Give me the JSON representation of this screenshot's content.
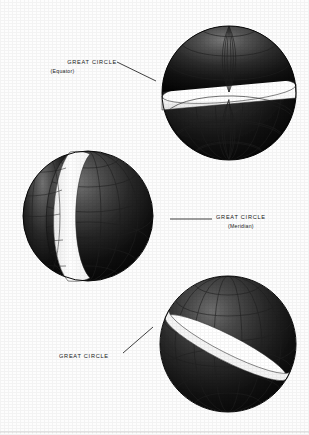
{
  "figure": {
    "background_color": "#fdfdfd",
    "ink_color": "#111111",
    "band_color": "#ffffff",
    "width": 309,
    "height": 435,
    "bottom_rule": true
  },
  "labels": [
    {
      "id": "equator",
      "text": "GREAT CIRCLE",
      "sub": "(Equator)",
      "x": 59,
      "y": 58,
      "leader": {
        "x1": 117,
        "y1": 62,
        "x2": 156,
        "y2": 81
      }
    },
    {
      "id": "meridian",
      "text": "GREAT CIRCLE",
      "sub": "(Meridian)",
      "x": 216,
      "y": 213,
      "leader": {
        "x1": 170,
        "y1": 219,
        "x2": 212,
        "y2": 219
      }
    },
    {
      "id": "oblique",
      "text": "GREAT CIRCLE",
      "sub": "",
      "x": 59,
      "y": 352,
      "leader": {
        "x1": 123,
        "y1": 353,
        "x2": 153,
        "y2": 327
      }
    }
  ],
  "spheres": [
    {
      "id": "sphere-equator",
      "name": "sphere-sliced-equatorial",
      "cx": 229,
      "cy": 93,
      "r": 67,
      "slice": "equatorial",
      "band_angle_deg": 9,
      "description": "Sphere split by a horizontal equatorial plane; white band visible"
    },
    {
      "id": "sphere-meridian",
      "name": "sphere-sliced-meridian",
      "cx": 88,
      "cy": 216,
      "r": 65,
      "slice": "meridian",
      "band_angle_deg": 82,
      "description": "Sphere split by a vertical meridian plane; white crescent band visible"
    },
    {
      "id": "sphere-oblique",
      "name": "sphere-sliced-oblique",
      "cx": 228,
      "cy": 344,
      "r": 68,
      "slice": "oblique",
      "band_angle_deg": 28,
      "description": "Sphere split by a tilted oblique plane; white elliptical band visible"
    }
  ],
  "grid": {
    "parallels": 5,
    "meridians": 7,
    "line_color": "#2b2b2b"
  }
}
